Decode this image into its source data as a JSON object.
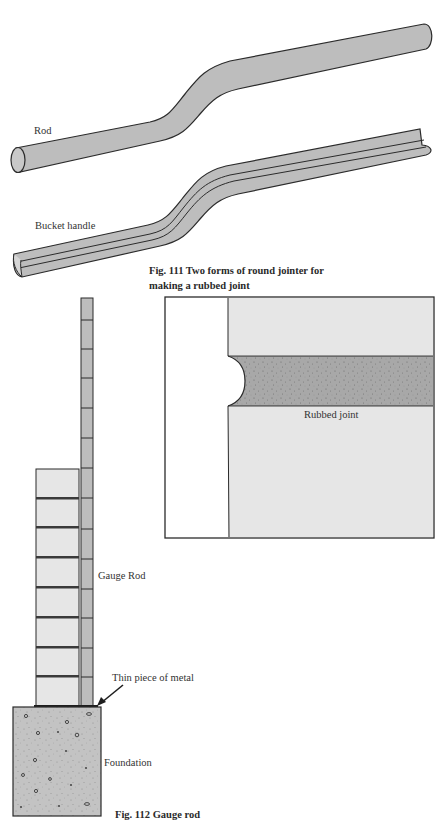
{
  "fig111": {
    "labels": {
      "rod": "Rod",
      "bucket_handle": "Bucket handle"
    },
    "caption_line1": "Fig. 111 Two forms of round jointer for",
    "caption_line2": "making a rubbed joint"
  },
  "joint_detail": {
    "label": "Rubbed joint"
  },
  "fig112": {
    "labels": {
      "gauge_rod": "Gauge Rod",
      "thin_metal": "Thin piece of metal",
      "foundation": "Foundation"
    },
    "caption": "Fig. 112 Gauge rod",
    "rod_segments": 13,
    "brick_courses": 8
  },
  "colors": {
    "rod_fill": "#bdbdbd",
    "brick_fill": "#e6e6e6",
    "mortar_fill": "#a9a9a9",
    "foundation_fill": "#c4c4c4",
    "outline": "#2b2b2b"
  }
}
